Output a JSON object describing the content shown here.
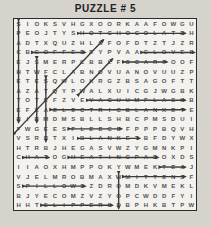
{
  "title": "PUZZLE # 5",
  "colors": {
    "background": "#d6d2cc",
    "grid_background": "#f4f2ee",
    "grid_border": "#2b2b2b",
    "letter_color": "#525252",
    "strike_color": "#3a3a3a",
    "title_color": "#222222"
  },
  "puzzle": {
    "grid_size": {
      "rows": 20,
      "cols": 20
    },
    "rows": [
      "SIOKSVHGXOORKAAFOWGU",
      "PEOJTYSHOTCHOCOLATEH",
      "ADTXQUZHLSFOFDTZTJZR",
      "CBCOFFEEEYPVAAGLOVES",
      "EJSMERPCBBLFSCARFOOF",
      "HTWFCLABNOVUANOVUUZP",
      "ETESQWLOKRGZBSAGOFTT",
      "AZATQYPWALXUICGJWGBK",
      "TOTEFZVEVACUUMFLASKB",
      "EFEAELECTRICBLANKETE",
      "RIRMDMSBLLSHBCPMSDUI",
      "FWGEESFLEECEFPPPBQVH",
      "VSRRTXIBLANKETBFDYWX",
      "HTRBJHEGASVWZYGMNKPI",
      "CHATOGHEATINGPADOXDS",
      "IIAOXHMPPOKYWMEKTEAJ",
      "VJELMROBMAXWMITTENSF",
      "SPILLOWSZDROMDKVMEKL",
      "BJYECOMZVZYOPCWDDFYI",
      "HHTSLIPPERSDBPHKBTPW"
    ],
    "found_words": [
      {
        "word": "SPACEHEATER",
        "row": 1,
        "col": 1,
        "dir": "down",
        "len": 11
      },
      {
        "word": "SWEATER",
        "row": 5,
        "col": 3,
        "dir": "down",
        "len": 7
      },
      {
        "word": "STEAMER",
        "row": 7,
        "col": 4,
        "dir": "down",
        "len": 7
      },
      {
        "word": "HOTCHOCOLATE",
        "row": 2,
        "col": 8,
        "dir": "right",
        "len": 12
      },
      {
        "word": "COFFEE",
        "row": 4,
        "col": 3,
        "dir": "right",
        "len": 6
      },
      {
        "word": "GLOVES",
        "row": 4,
        "col": 15,
        "dir": "right",
        "len": 6
      },
      {
        "word": "SCARF",
        "row": 5,
        "col": 13,
        "dir": "right",
        "len": 5
      },
      {
        "word": "FIREPLACES",
        "row": 12,
        "col": 1,
        "dir": "up-right",
        "len": 10
      },
      {
        "word": "WOOL",
        "row": 8,
        "col": 8,
        "dir": "up-right",
        "len": 4
      },
      {
        "word": "VACUUMFLASK",
        "row": 9,
        "col": 9,
        "dir": "right",
        "len": 11
      },
      {
        "word": "ELECTRICBLANKET",
        "row": 10,
        "col": 5,
        "dir": "right",
        "len": 15
      },
      {
        "word": "FLEECE",
        "row": 12,
        "col": 7,
        "dir": "right",
        "len": 6
      },
      {
        "word": "BLANKET",
        "row": 13,
        "col": 8,
        "dir": "right",
        "len": 7
      },
      {
        "word": "HAT",
        "row": 15,
        "col": 2,
        "dir": "right",
        "len": 3
      },
      {
        "word": "HEATINGPAD",
        "row": 15,
        "col": 7,
        "dir": "right",
        "len": 10
      },
      {
        "word": "TEA",
        "row": 16,
        "col": 17,
        "dir": "right",
        "len": 3
      },
      {
        "word": "MITTENS",
        "row": 17,
        "col": 13,
        "dir": "right",
        "len": 7
      },
      {
        "word": "WOOD",
        "row": 17,
        "col": 12,
        "dir": "down",
        "len": 4
      },
      {
        "word": "PILLOWS",
        "row": 18,
        "col": 2,
        "dir": "right",
        "len": 7
      },
      {
        "word": "SLIPPERS",
        "row": 20,
        "col": 4,
        "dir": "right",
        "len": 8
      }
    ]
  }
}
